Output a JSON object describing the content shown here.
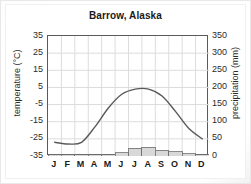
{
  "figure": {
    "title": "Barrow, Alaska"
  },
  "axes": {
    "left_title": "temperature (°C)",
    "right_title": "precipitation (mm)",
    "left_ticks": [
      "35",
      "25",
      "15",
      "5",
      "-5",
      "-15",
      "-25",
      "-35"
    ],
    "right_ticks": [
      "350",
      "300",
      "250",
      "200",
      "150",
      "100",
      "50",
      "0"
    ],
    "months": [
      "J",
      "F",
      "M",
      "A",
      "M",
      "J",
      "J",
      "A",
      "S",
      "O",
      "N",
      "D"
    ]
  },
  "colors": {
    "line": "#595959",
    "bar_fill": "#d8d8d8",
    "bar_stroke": "#6e6e6e",
    "grid": "#dcdcdc",
    "frame": "#5a5a5a",
    "text": "#1a1a1a",
    "background": "#ffffff"
  },
  "chart_data": {
    "type": "line",
    "title": "Barrow, Alaska",
    "xlabel": "",
    "ylabel": "temperature (°C)",
    "y2label": "precipitation (mm)",
    "categories": [
      "J",
      "F",
      "M",
      "A",
      "M",
      "J",
      "J",
      "A",
      "S",
      "O",
      "N",
      "D"
    ],
    "ylim": [
      -35,
      35
    ],
    "y2lim": [
      0,
      350
    ],
    "grid": true,
    "legend": "none",
    "series": [
      {
        "name": "temperature",
        "type": "line",
        "axis": "left",
        "unit": "°C",
        "values": [
          -27,
          -28,
          -27,
          -18,
          -7,
          1,
          4,
          4,
          0,
          -9,
          -19,
          -25
        ]
      },
      {
        "name": "precipitation",
        "type": "bar",
        "axis": "right",
        "unit": "mm",
        "values": [
          4,
          3,
          3,
          3,
          4,
          9,
          22,
          25,
          17,
          13,
          6,
          4
        ]
      }
    ]
  }
}
